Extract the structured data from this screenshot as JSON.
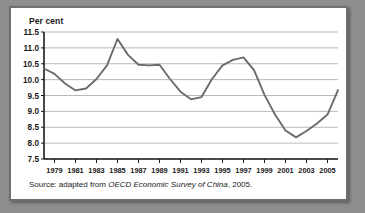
{
  "figure": {
    "axis_title": "Per cent",
    "source_prefix": "Source: adapted from ",
    "source_italic": "OECD Economic Survey of China",
    "source_suffix": ", 2005."
  },
  "colors": {
    "page_background": "#8e8e8e",
    "panel_background": "#ffffff",
    "frame_border": "#6f6f6f",
    "line": "#6b6b6b",
    "gridline": "#b9b9b9",
    "axis": "#1a1a1a",
    "text": "#1a1a1a"
  },
  "chart_data": {
    "type": "line",
    "title": "",
    "subtitle": "",
    "xlabel": "",
    "ylabel": "Per cent",
    "ylim": [
      7.5,
      11.5
    ],
    "ytick_step": 0.5,
    "ytick_labels": [
      "11.5",
      "11.0",
      "10.5",
      "10.0",
      "9.5",
      "9.0",
      "8.5",
      "8.0",
      "7.5"
    ],
    "ytick_values": [
      11.5,
      11.0,
      10.5,
      10.0,
      9.5,
      9.0,
      8.5,
      8.0,
      7.5
    ],
    "xlim": [
      1978,
      2006
    ],
    "xtick_labels": [
      "1979",
      "1981",
      "1983",
      "1985",
      "1987",
      "1989",
      "1991",
      "1993",
      "1995",
      "1997",
      "1999",
      "2001",
      "2003",
      "2005"
    ],
    "xtick_values": [
      1979,
      1981,
      1983,
      1985,
      1987,
      1989,
      1991,
      1993,
      1995,
      1997,
      1999,
      2001,
      2003,
      2005
    ],
    "grid": true,
    "grid_axis": "y",
    "legend": false,
    "legend_position": "none",
    "series": [
      {
        "name": "Per cent",
        "x": [
          1978,
          1979,
          1980,
          1981,
          1982,
          1983,
          1984,
          1985,
          1986,
          1987,
          1988,
          1989,
          1990,
          1991,
          1992,
          1993,
          1994,
          1995,
          1996,
          1997,
          1998,
          1999,
          2000,
          2001,
          2002,
          2003,
          2004,
          2005,
          2006
        ],
        "values": [
          10.35,
          10.18,
          9.88,
          9.66,
          9.72,
          10.02,
          10.45,
          11.28,
          10.78,
          10.47,
          10.45,
          10.47,
          10.02,
          9.62,
          9.38,
          9.45,
          10.02,
          10.45,
          10.62,
          10.7,
          10.3,
          9.52,
          8.9,
          8.4,
          8.18,
          8.38,
          8.62,
          8.9,
          9.67
        ]
      }
    ]
  }
}
